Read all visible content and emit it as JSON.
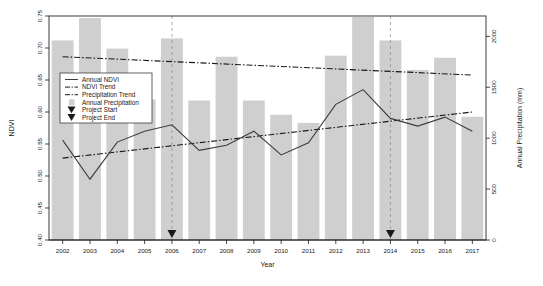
{
  "figure": {
    "name": "ndvi-precipitation-timeseries",
    "background_color": "#ffffff",
    "border_color": "#3d3d3d"
  },
  "axes": {
    "x": {
      "label": "Year",
      "ticks": [
        "2002",
        "2003",
        "2004",
        "2005",
        "2006",
        "2007",
        "2008",
        "2009",
        "2010",
        "2011",
        "2012",
        "2013",
        "2014",
        "2015",
        "2016",
        "2017"
      ],
      "range": [
        2001.5,
        2017.5
      ]
    },
    "y_left": {
      "label": "NDVI",
      "ticks": [
        "0.40",
        "0.45",
        "0.50",
        "0.55",
        "0.60",
        "0.65",
        "0.70",
        "0.75"
      ],
      "range": [
        0.4,
        0.75
      ]
    },
    "y_right": {
      "label": "Annual Precipitation (mm)",
      "ticks": [
        "0",
        "500",
        "1000",
        "1500",
        "2000"
      ],
      "range": [
        0,
        2200
      ]
    }
  },
  "legend": {
    "items": [
      {
        "label": "Annual NDVI",
        "marker": "solid-line",
        "color": "#3d3d3d"
      },
      {
        "label": "NDVI Trend",
        "marker": "dashdot-line",
        "color": "#1a1a1a"
      },
      {
        "label": "Precipitation Trend",
        "marker": "dashdot-line",
        "color": "#1a1a1a"
      },
      {
        "label": "Annual Precipitation",
        "marker": "filled-square",
        "color": "#cfcfcf"
      },
      {
        "label": "Project Start",
        "marker": "down-triangle",
        "color": "#1a1a1a"
      },
      {
        "label": "Project End",
        "marker": "down-triangle",
        "color": "#1a1a1a"
      }
    ]
  },
  "annotations": {
    "project_start": {
      "label": "Project Start",
      "year": 2006
    },
    "project_end": {
      "label": "Project End",
      "year": 2014
    }
  },
  "chart_data": {
    "type": "bar",
    "title": "",
    "xlabel": "Year",
    "ylabel": "NDVI",
    "y2label": "Annual Precipitation (mm)",
    "grid": false,
    "legend_position": "upper-left-inside",
    "categories": [
      2002,
      2003,
      2004,
      2005,
      2006,
      2007,
      2008,
      2009,
      2010,
      2011,
      2012,
      2013,
      2014,
      2015,
      2016,
      2017
    ],
    "series": [
      {
        "name": "Annual Precipitation",
        "type": "bar",
        "axis": "y2",
        "unit": "mm",
        "color": "#cfcfcf",
        "values": [
          1960,
          2180,
          1880,
          1380,
          1980,
          1370,
          1800,
          1370,
          1230,
          1150,
          1810,
          2190,
          1960,
          1670,
          1790,
          1210
        ]
      },
      {
        "name": "Annual NDVI",
        "type": "line",
        "axis": "y1",
        "color": "#3d3d3d",
        "values": [
          0.556,
          0.495,
          0.553,
          0.57,
          0.58,
          0.54,
          0.548,
          0.57,
          0.533,
          0.552,
          0.612,
          0.635,
          0.59,
          0.578,
          0.592,
          0.57
        ]
      },
      {
        "name": "NDVI Trend",
        "type": "trendline",
        "axis": "y1",
        "color": "#1a1a1a",
        "endpoints": [
          {
            "x": 2002,
            "y": 0.528
          },
          {
            "x": 2017,
            "y": 0.6
          }
        ]
      },
      {
        "name": "Precipitation Trend",
        "type": "trendline",
        "axis": "y2",
        "unit": "mm",
        "color": "#1a1a1a",
        "endpoints": [
          {
            "x": 2002,
            "y": 1800
          },
          {
            "x": 2017,
            "y": 1620
          }
        ]
      }
    ],
    "ylim": [
      0.4,
      0.75
    ],
    "y2lim": [
      0,
      2200
    ],
    "xlim": [
      2001.5,
      2017.5
    ]
  }
}
